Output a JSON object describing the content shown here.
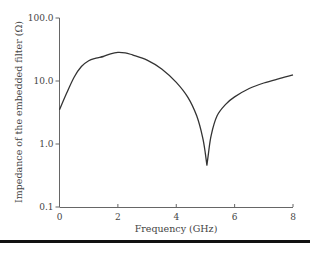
{
  "chart_data": {
    "type": "line",
    "title": "",
    "xlabel": "Frequency (GHz)",
    "ylabel": "Impedance of the embedded filter (Ω)",
    "xlim": [
      0,
      8
    ],
    "ylim": [
      0.1,
      100
    ],
    "yscale": "log",
    "grid": false,
    "legend": null,
    "x_ticks": [
      "0",
      "2",
      "4",
      "6",
      "8"
    ],
    "y_ticks": [
      "0.1",
      "1.0",
      "10.0",
      "100.0"
    ],
    "series": [
      {
        "name": "Impedance",
        "color": "#333333",
        "x": [
          0.0,
          0.25,
          0.5,
          0.75,
          1.0,
          1.25,
          1.5,
          1.75,
          2.0,
          2.25,
          2.5,
          3.0,
          3.5,
          4.0,
          4.4,
          4.7,
          4.9,
          5.0,
          5.05,
          5.1,
          5.2,
          5.4,
          5.7,
          6.0,
          6.5,
          7.0,
          7.5,
          8.0
        ],
        "y": [
          3.5,
          6.5,
          11.5,
          17.0,
          21.0,
          23.0,
          24.5,
          27.0,
          28.5,
          28.0,
          26.0,
          21.5,
          15.5,
          9.5,
          5.5,
          2.8,
          1.3,
          0.7,
          0.46,
          0.7,
          1.4,
          2.8,
          4.3,
          5.6,
          7.6,
          9.3,
          10.8,
          12.5
        ]
      }
    ]
  }
}
